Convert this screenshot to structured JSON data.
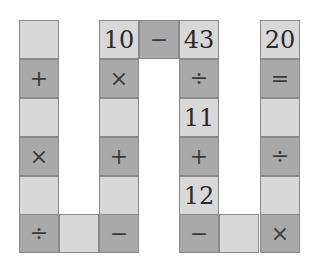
{
  "puzzle": {
    "colors": {
      "light": "#d8d8d8",
      "dark": "#a9a9a9",
      "border": "#8a8a8a"
    },
    "cells": [
      {
        "id": "c0",
        "x": 19,
        "y": 20,
        "shade": "light",
        "kind": "empty",
        "value": ""
      },
      {
        "id": "c1",
        "x": 19,
        "y": 59,
        "shade": "dark",
        "kind": "op",
        "value": "+"
      },
      {
        "id": "c2",
        "x": 19,
        "y": 98,
        "shade": "light",
        "kind": "empty",
        "value": ""
      },
      {
        "id": "c3",
        "x": 19,
        "y": 137,
        "shade": "dark",
        "kind": "op",
        "value": "×"
      },
      {
        "id": "c4",
        "x": 19,
        "y": 176,
        "shade": "light",
        "kind": "empty",
        "value": ""
      },
      {
        "id": "c5",
        "x": 19,
        "y": 214,
        "shade": "dark",
        "kind": "op",
        "value": "÷"
      },
      {
        "id": "c6",
        "x": 59,
        "y": 214,
        "shade": "light",
        "kind": "empty",
        "value": ""
      },
      {
        "id": "c7",
        "x": 99,
        "y": 214,
        "shade": "dark",
        "kind": "op",
        "value": "−"
      },
      {
        "id": "c8",
        "x": 99,
        "y": 176,
        "shade": "light",
        "kind": "empty",
        "value": ""
      },
      {
        "id": "c9",
        "x": 99,
        "y": 137,
        "shade": "dark",
        "kind": "op",
        "value": "+"
      },
      {
        "id": "c10",
        "x": 99,
        "y": 98,
        "shade": "light",
        "kind": "empty",
        "value": ""
      },
      {
        "id": "c11",
        "x": 99,
        "y": 59,
        "shade": "dark",
        "kind": "op",
        "value": "×"
      },
      {
        "id": "c12",
        "x": 99,
        "y": 20,
        "shade": "light",
        "kind": "num",
        "value": "10"
      },
      {
        "id": "c13",
        "x": 139,
        "y": 20,
        "shade": "dark",
        "kind": "op",
        "value": "−"
      },
      {
        "id": "c14",
        "x": 179,
        "y": 20,
        "shade": "light",
        "kind": "num",
        "value": "43"
      },
      {
        "id": "c15",
        "x": 179,
        "y": 59,
        "shade": "dark",
        "kind": "op",
        "value": "÷"
      },
      {
        "id": "c16",
        "x": 179,
        "y": 98,
        "shade": "light",
        "kind": "num",
        "value": "11"
      },
      {
        "id": "c17",
        "x": 179,
        "y": 137,
        "shade": "dark",
        "kind": "op",
        "value": "+"
      },
      {
        "id": "c18",
        "x": 179,
        "y": 176,
        "shade": "light",
        "kind": "num",
        "value": "12"
      },
      {
        "id": "c19",
        "x": 179,
        "y": 214,
        "shade": "dark",
        "kind": "op",
        "value": "−"
      },
      {
        "id": "c20",
        "x": 219,
        "y": 214,
        "shade": "light",
        "kind": "empty",
        "value": ""
      },
      {
        "id": "c21",
        "x": 260,
        "y": 214,
        "shade": "dark",
        "kind": "op",
        "value": "×"
      },
      {
        "id": "c22",
        "x": 260,
        "y": 176,
        "shade": "light",
        "kind": "empty",
        "value": ""
      },
      {
        "id": "c23",
        "x": 260,
        "y": 137,
        "shade": "dark",
        "kind": "op",
        "value": "÷"
      },
      {
        "id": "c24",
        "x": 260,
        "y": 98,
        "shade": "light",
        "kind": "empty",
        "value": ""
      },
      {
        "id": "c25",
        "x": 260,
        "y": 59,
        "shade": "dark",
        "kind": "op",
        "value": "="
      },
      {
        "id": "c26",
        "x": 260,
        "y": 20,
        "shade": "light",
        "kind": "num",
        "value": "20"
      }
    ]
  }
}
